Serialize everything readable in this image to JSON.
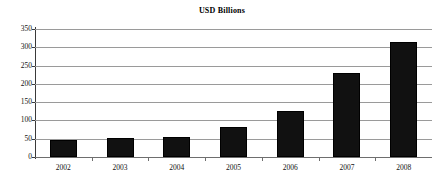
{
  "chart_data": {
    "type": "bar",
    "title": "USD Billions",
    "xlabel": "",
    "ylabel": "",
    "categories": [
      "2002",
      "2003",
      "2004",
      "2005",
      "2006",
      "2007",
      "2008"
    ],
    "values": [
      47,
      53,
      56,
      81,
      125,
      231,
      315
    ],
    "ylim": [
      0,
      350
    ],
    "yticks": [
      0,
      50,
      100,
      150,
      200,
      250,
      300,
      350
    ],
    "ytick_labels": [
      "0",
      "50",
      "100",
      "150",
      "200",
      "250",
      "300",
      "350"
    ],
    "grid": true,
    "legend": null,
    "series": [
      {
        "name": "USD Billions",
        "color": "#111111",
        "values": [
          47,
          53,
          56,
          81,
          125,
          231,
          315
        ]
      }
    ]
  }
}
